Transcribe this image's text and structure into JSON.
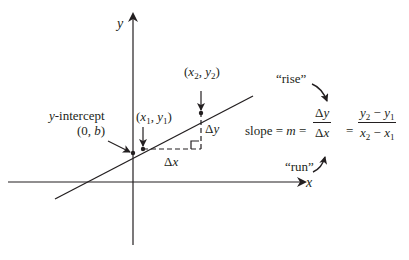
{
  "diagram": {
    "axes": {
      "x_label": "x",
      "y_label": "y"
    },
    "points": {
      "y_intercept": {
        "label_line1": "y-intercept",
        "label_line2": "(0, b)"
      },
      "p1": {
        "label": "(x1, y1)",
        "x_sub": "1",
        "y_sub": "1"
      },
      "p2": {
        "label": "(x2, y2)",
        "x_sub": "2",
        "y_sub": "2"
      }
    },
    "deltas": {
      "dx": "Δx",
      "dy": "Δy"
    },
    "formula": {
      "prefix": "slope = m =",
      "frac1_num": "Δy",
      "frac1_den": "Δx",
      "eq": "=",
      "frac2_num": "y2 − y1",
      "frac2_den": "x2 − x1",
      "rise_label": "“rise”",
      "run_label": "“run”"
    },
    "colors": {
      "ink": "#231f20",
      "background": "#ffffff"
    }
  }
}
